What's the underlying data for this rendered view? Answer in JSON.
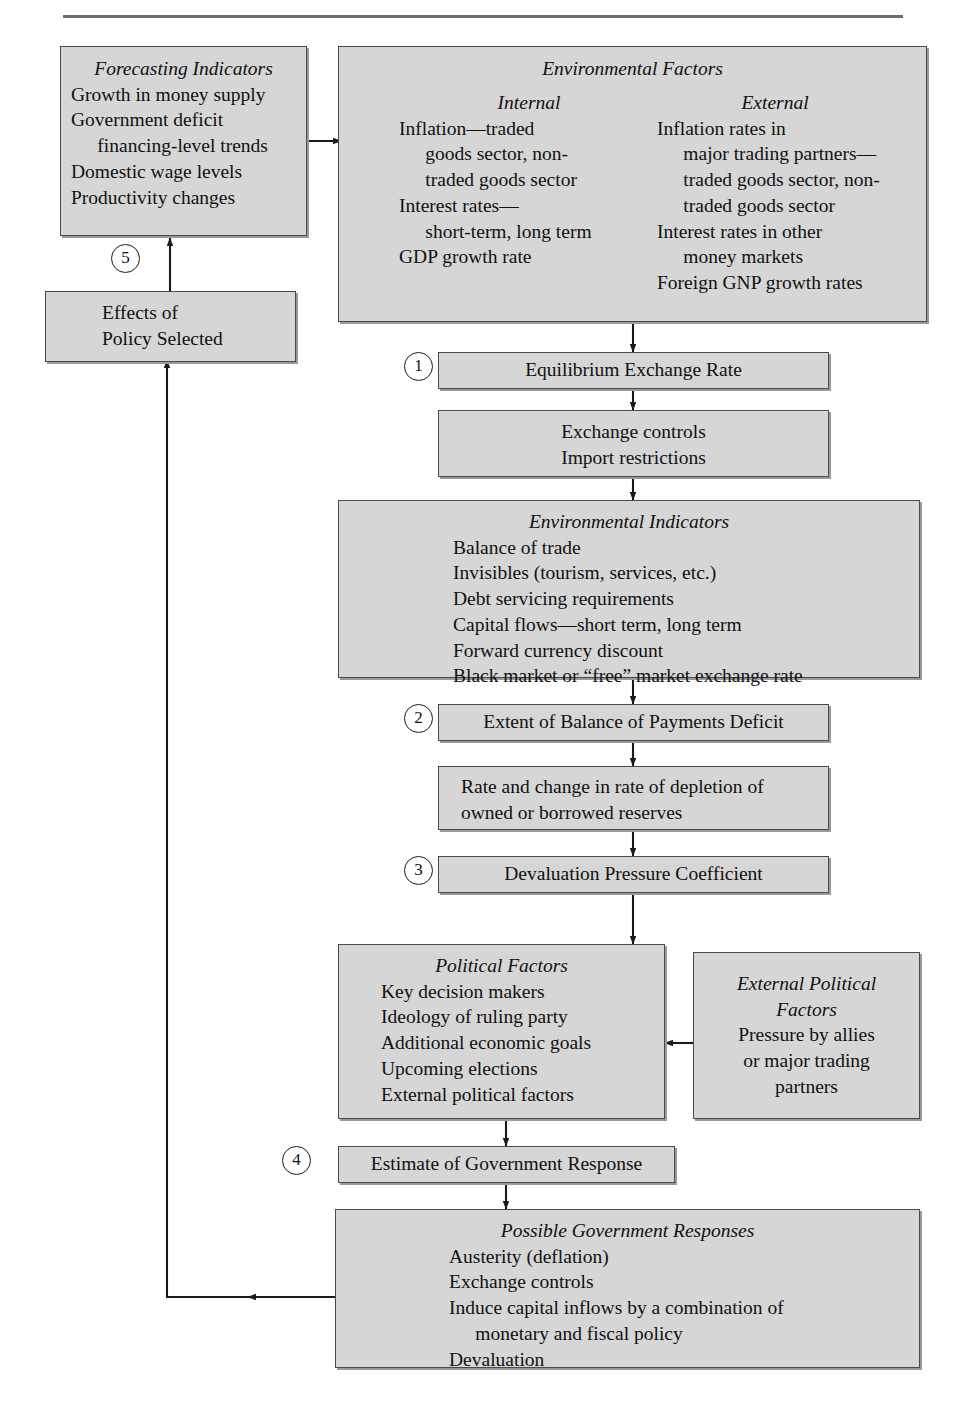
{
  "figure": {
    "domain_note": "flowchart",
    "boxes": {
      "forecasting_indicators": {
        "title": "Forecasting Indicators",
        "lines": [
          "Growth in money supply",
          "Government deficit",
          "financing-level trends",
          "Domestic wage levels",
          "Productivity changes"
        ]
      },
      "environmental_factors": {
        "title": "Environmental Factors",
        "internal_heading": "Internal",
        "external_heading": "External",
        "internal_lines": [
          "Inflation—traded",
          "goods sector, non-",
          "traded goods sector",
          "Interest rates—",
          "short-term, long term",
          "GDP growth rate"
        ],
        "external_lines": [
          "Inflation rates in",
          "major trading partners—",
          "traded goods sector, non-",
          "traded goods sector",
          "Interest rates in other",
          "money markets",
          "Foreign GNP growth rates"
        ]
      },
      "effects_of_policy": {
        "lines": [
          "Effects of",
          "Policy Selected"
        ]
      },
      "equilibrium_exchange_rate": {
        "label": "Equilibrium Exchange Rate"
      },
      "exchange_controls": {
        "lines": [
          "Exchange controls",
          "Import restrictions"
        ]
      },
      "environmental_indicators": {
        "title": "Environmental Indicators",
        "lines": [
          "Balance of trade",
          "Invisibles (tourism, services, etc.)",
          "Debt servicing requirements",
          "Capital flows—short term, long term",
          "Forward currency discount",
          "Black market or “free” market exchange rate"
        ]
      },
      "extent_of_bop_deficit": {
        "label": "Extent of Balance of Payments Deficit"
      },
      "rate_of_depletion": {
        "lines": [
          "Rate and change in rate of depletion of",
          "owned or borrowed reserves"
        ]
      },
      "devaluation_pressure_coefficient": {
        "label": "Devaluation Pressure Coefficient"
      },
      "political_factors": {
        "title": "Political Factors",
        "lines": [
          "Key decision makers",
          "Ideology of ruling party",
          "Additional economic goals",
          "Upcoming elections",
          "External political factors"
        ]
      },
      "external_political_factors": {
        "title_lines": [
          "External Political",
          "Factors"
        ],
        "lines": [
          "Pressure by allies",
          "or major trading",
          "partners"
        ]
      },
      "estimate_of_government_response": {
        "label": "Estimate of Government Response"
      },
      "possible_government_responses": {
        "title": "Possible Government Responses",
        "lines": [
          "Austerity (deflation)",
          "Exchange controls",
          "Induce capital inflows by a combination of",
          "monetary and fiscal policy",
          "Devaluation"
        ]
      }
    },
    "step_markers": [
      "1",
      "2",
      "3",
      "4",
      "5"
    ],
    "colors": {
      "box_fill": "#d6d6d6",
      "box_border": "#4a4a4a",
      "arrow": "#1a1a1a",
      "rule": "#6d6d6d",
      "text": "#111111"
    }
  }
}
